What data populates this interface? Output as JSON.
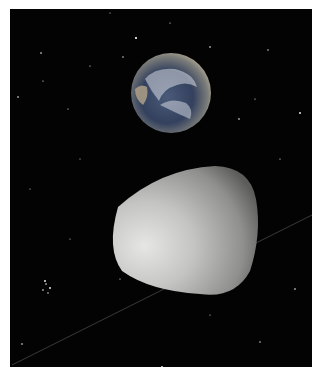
{
  "scene": {
    "description": "Space scene: Earth above a smooth grey asteroid with an orbit line against a starfield",
    "background_color": "#030303",
    "border_color": "#ffffff",
    "earth": {
      "label": "earth",
      "cx": 161,
      "cy": 84,
      "r": 40
    },
    "asteroid": {
      "label": "asteroid",
      "color": "#c8c8c6"
    },
    "orbit_line": {
      "label": "orbit-path",
      "color": "#3a3a3a"
    }
  }
}
